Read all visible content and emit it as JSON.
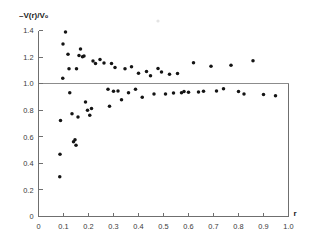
{
  "chart_data": {
    "type": "scatter",
    "title": "",
    "subtitle": "",
    "xlabel": "r",
    "ylabel": "-V(r)/V0",
    "ylabel_display": "–V(r)/V₀",
    "xlim": [
      0,
      1.0
    ],
    "ylim": [
      0,
      1.4
    ],
    "grid": false,
    "legend": null,
    "marker": "filled-circle",
    "marker_color": "#141414",
    "annotations": [
      {
        "type": "horizontal-line",
        "y": 1.0,
        "label": "",
        "color": "#8c8c8c",
        "note": "reference line at -V(r)/V0 = 1.0 spanning full plot width"
      }
    ],
    "x_ticks": [
      0,
      0.1,
      0.2,
      0.3,
      0.4,
      0.5,
      0.6,
      0.7,
      0.8,
      0.9,
      1.0
    ],
    "x_tick_labels": [
      "0",
      "0.1",
      "0.2",
      "0.3",
      "0.4",
      "0.5",
      "0.6",
      "0.7",
      "0.8",
      "0.9",
      "1.0"
    ],
    "y_ticks": [
      0,
      0.2,
      0.4,
      0.6,
      0.8,
      1.0,
      1.2,
      1.4
    ],
    "y_tick_labels": [
      "0",
      "0.2",
      "0.4",
      "0.6",
      "0.8",
      "1.0",
      "1.2",
      "1.4"
    ],
    "x": [
      0.085,
      0.086,
      0.088,
      0.097,
      0.098,
      0.108,
      0.118,
      0.122,
      0.125,
      0.134,
      0.14,
      0.146,
      0.15,
      0.152,
      0.158,
      0.162,
      0.168,
      0.176,
      0.182,
      0.188,
      0.196,
      0.205,
      0.212,
      0.218,
      0.228,
      0.246,
      0.262,
      0.278,
      0.284,
      0.292,
      0.3,
      0.306,
      0.318,
      0.332,
      0.346,
      0.36,
      0.372,
      0.388,
      0.4,
      0.415,
      0.432,
      0.448,
      0.462,
      0.478,
      0.492,
      0.508,
      0.524,
      0.54,
      0.556,
      0.572,
      0.582,
      0.6,
      0.62,
      0.64,
      0.66,
      0.69,
      0.712,
      0.74,
      0.77,
      0.8,
      0.822,
      0.858,
      0.9,
      0.948
    ],
    "y": [
      0.3,
      0.468,
      0.722,
      1.04,
      1.298,
      1.388,
      1.222,
      1.112,
      0.932,
      0.774,
      0.562,
      0.578,
      0.536,
      1.112,
      0.748,
      1.212,
      1.26,
      1.202,
      1.208,
      0.862,
      0.8,
      0.762,
      0.812,
      1.17,
      1.152,
      1.182,
      1.156,
      0.958,
      0.83,
      1.152,
      0.942,
      1.122,
      0.944,
      0.878,
      1.112,
      0.932,
      1.128,
      0.958,
      1.078,
      0.898,
      1.092,
      1.06,
      0.922,
      1.114,
      1.088,
      0.922,
      1.07,
      0.93,
      1.076,
      0.932,
      0.94,
      0.936,
      1.158,
      0.938,
      0.942,
      1.13,
      0.944,
      0.962,
      1.138,
      0.94,
      0.922,
      1.172,
      0.918,
      0.908
    ]
  }
}
